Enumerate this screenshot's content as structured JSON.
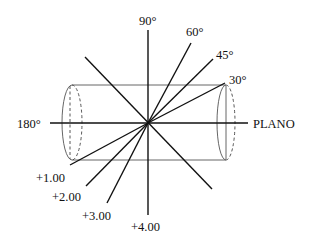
{
  "diagram": {
    "type": "cross-cylinder meridian diagram",
    "cylinder_axis_label": "PLANO",
    "meridians": [
      {
        "angle_deg": 90,
        "label": "90°"
      },
      {
        "angle_deg": 60,
        "label": "60°"
      },
      {
        "angle_deg": 45,
        "label": "45°"
      },
      {
        "angle_deg": 30,
        "label": "30°"
      },
      {
        "angle_deg": 180,
        "label": "180°"
      },
      {
        "angle_deg": 135,
        "label": ""
      }
    ],
    "powers": [
      {
        "label": "+1.00"
      },
      {
        "label": "+2.00"
      },
      {
        "label": "+3.00"
      },
      {
        "label": "+4.00"
      }
    ]
  }
}
